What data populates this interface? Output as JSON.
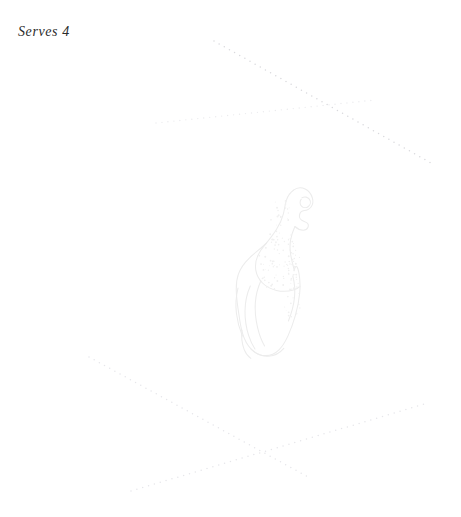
{
  "page": {
    "width": 461,
    "height": 517,
    "background_color": "#ffffff",
    "kind": "cookbook-recipe-page-decoration"
  },
  "serving_note": {
    "text": "Serves 4",
    "style": "italic-serif",
    "color": "#2b2b2b",
    "font_size_px": 14,
    "position": {
      "x": 18,
      "y": 25
    }
  },
  "illustration": {
    "name": "leg-of-ham-illustration",
    "subject": "leg of ham / leg of lamb with bone shank",
    "style": "faint line art with stipple shading",
    "stroke_color": "#ececec",
    "stipple_color": "#f0f0f0",
    "bounds": {
      "x": 228,
      "y": 186,
      "width": 95,
      "height": 172
    }
  },
  "dotted_rules": [
    {
      "name": "dotted-rule-top-descending",
      "x1": 214,
      "y1": 41,
      "x2": 431,
      "y2": 163,
      "color": "#d9d9dd",
      "dot_size": 1.5,
      "dot_gap": 4.4
    },
    {
      "name": "dotted-rule-top-ascending",
      "x1": 156,
      "y1": 123,
      "x2": 375,
      "y2": 100,
      "color": "#ebebee",
      "dot_size": 1.4,
      "dot_gap": 4.6
    },
    {
      "name": "dotted-rule-bottom-descending",
      "x1": 89,
      "y1": 357,
      "x2": 310,
      "y2": 478,
      "color": "#e6e6ea",
      "dot_size": 1.5,
      "dot_gap": 4.4
    },
    {
      "name": "dotted-rule-bottom-ascending",
      "x1": 131,
      "y1": 491,
      "x2": 428,
      "y2": 403,
      "color": "#e6e6ea",
      "dot_size": 1.5,
      "dot_gap": 4.6
    }
  ]
}
